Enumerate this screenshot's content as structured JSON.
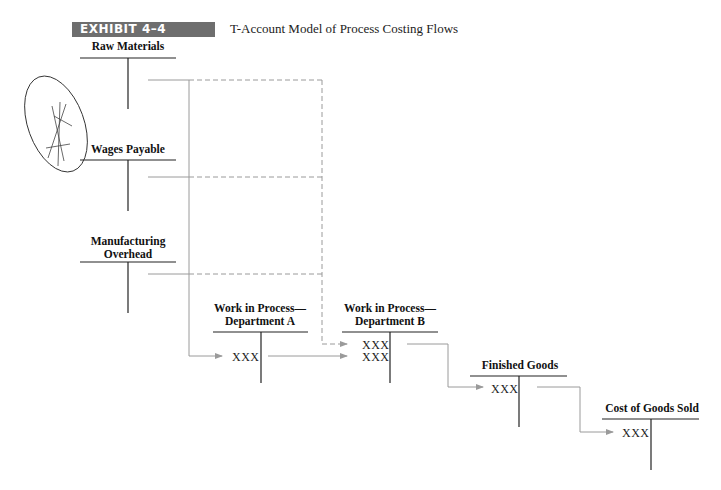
{
  "header": {
    "exhibit_label": "EXHIBIT 4–4",
    "title": "T-Account Model of Process Costing Flows",
    "badge_color": "#6e6e6e"
  },
  "accounts": [
    {
      "id": "raw-materials",
      "name": "Raw Materials",
      "entries": []
    },
    {
      "id": "wages-payable",
      "name": "Wages Payable",
      "entries": []
    },
    {
      "id": "manufacturing-overhead",
      "name_line1": "Manufacturing",
      "name_line2": "Overhead",
      "entries": []
    },
    {
      "id": "wip-dept-a",
      "name_line1": "Work in Process—",
      "name_line2": "Department A",
      "entries": [
        "XXX"
      ]
    },
    {
      "id": "wip-dept-b",
      "name_line1": "Work in Process—",
      "name_line2": "Department B",
      "entries": [
        "XXX",
        "XXX"
      ]
    },
    {
      "id": "finished-goods",
      "name": "Finished Goods",
      "entries": [
        "XXX"
      ]
    },
    {
      "id": "cost-of-goods-sold",
      "name": "Cost of Goods Sold",
      "entries": [
        "XXX"
      ]
    }
  ],
  "flows": [
    {
      "from": "Raw Materials",
      "to": "Work in Process—Department A",
      "style": "solid"
    },
    {
      "from": "Raw Materials",
      "to": "Work in Process—Department B",
      "style": "dashed"
    },
    {
      "from": "Wages Payable",
      "to": "Work in Process—Department A",
      "style": "solid"
    },
    {
      "from": "Wages Payable",
      "to": "Work in Process—Department B",
      "style": "dashed"
    },
    {
      "from": "Manufacturing Overhead",
      "to": "Work in Process—Department A",
      "style": "solid"
    },
    {
      "from": "Manufacturing Overhead",
      "to": "Work in Process—Department B",
      "style": "dashed"
    },
    {
      "from": "Work in Process—Department A",
      "to": "Work in Process—Department B",
      "style": "solid"
    },
    {
      "from": "Work in Process—Department B",
      "to": "Finished Goods",
      "style": "solid"
    },
    {
      "from": "Finished Goods",
      "to": "Cost of Goods Sold",
      "style": "solid"
    }
  ],
  "colors": {
    "line": "#111111",
    "flow": "#9a9a9a"
  }
}
